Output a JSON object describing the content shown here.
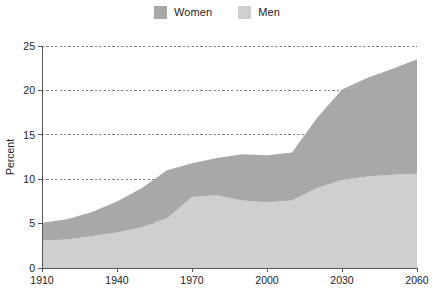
{
  "legend": {
    "position": "top-center",
    "entries": [
      {
        "label": "Women",
        "color": "#a8a8a8",
        "swatch_name": "legend-swatch-women"
      },
      {
        "label": "Men",
        "color": "#cfcfcf",
        "swatch_name": "legend-swatch-men"
      }
    ]
  },
  "chart_data": {
    "type": "area",
    "stacked": true,
    "title": "",
    "subtitle": "",
    "xlabel": "",
    "ylabel": "Percent",
    "xlim": [
      1910,
      2060
    ],
    "ylim": [
      0,
      25
    ],
    "grid": true,
    "xticks": [
      1910,
      1940,
      1970,
      2000,
      2030,
      2060
    ],
    "xtick_labels": [
      "1910",
      "1940",
      "1970",
      "2000",
      "2030",
      "2060"
    ],
    "yticks": [
      0,
      5,
      10,
      15,
      20,
      25
    ],
    "ytick_labels": [
      "0",
      "5",
      "10",
      "15",
      "20",
      "25"
    ],
    "x": [
      1910,
      1920,
      1930,
      1940,
      1950,
      1960,
      1970,
      1980,
      1990,
      2000,
      2010,
      2020,
      2030,
      2040,
      2050,
      2060
    ],
    "series": [
      {
        "name": "Men",
        "color": "#cfcfcf",
        "values": [
          3.1,
          3.2,
          3.6,
          4.0,
          4.6,
          5.6,
          8.0,
          8.2,
          7.6,
          7.4,
          7.6,
          9.0,
          9.9,
          10.3,
          10.5,
          10.6
        ]
      },
      {
        "name": "Women",
        "color": "#a8a8a8",
        "values": [
          2.0,
          2.3,
          2.7,
          3.5,
          4.4,
          5.4,
          3.8,
          4.2,
          5.2,
          5.3,
          5.4,
          7.9,
          10.2,
          11.1,
          11.9,
          12.9
        ]
      }
    ],
    "totals": [
      5.1,
      5.5,
      6.3,
      7.5,
      9.0,
      11.0,
      11.8,
      12.4,
      12.8,
      12.7,
      13.0,
      16.9,
      20.1,
      21.4,
      22.4,
      23.5
    ]
  },
  "colors": {
    "women": "#a8a8a8",
    "men": "#cfcfcf",
    "axis": "#55555a",
    "grid": "#7d7d85",
    "text": "#1c1c1c",
    "background": "#ffffff"
  }
}
